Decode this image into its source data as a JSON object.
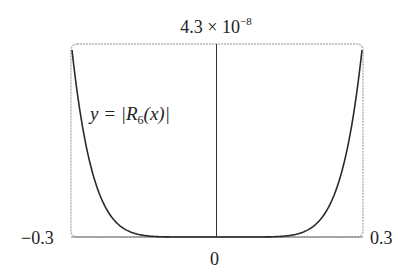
{
  "chart_data": {
    "type": "line",
    "title": "",
    "function_label": {
      "prefix": "y = |R",
      "subscript": "6",
      "suffix": "(x)|"
    },
    "xlabel": "",
    "ylabel": "",
    "xlim": [
      -0.3,
      0.3
    ],
    "ylim": [
      0,
      4.3e-08
    ],
    "x_tick_labels": {
      "left": "−0.3",
      "center": "0",
      "right": "0.3"
    },
    "y_max_label": {
      "mantissa": "4.3 × 10",
      "exponent": "−8"
    },
    "grid": false,
    "legend": "none",
    "series": [
      {
        "name": "|R6(x)|",
        "x": [
          -0.3,
          -0.25,
          -0.2,
          -0.15,
          -0.1,
          -0.05,
          0,
          0.05,
          0.1,
          0.15,
          0.2,
          0.25,
          0.3
        ],
        "values": [
          4.3e-08,
          1.19e-08,
          2.4e-09,
          3.4e-10,
          2e-11,
          1.6e-13,
          0,
          1.6e-13,
          2e-11,
          3.4e-10,
          2.4e-09,
          1.19e-08,
          4.3e-08
        ]
      }
    ],
    "colors": {
      "curve": "#2a2a2a",
      "axis": "#333333",
      "frame": "#b5b5b5"
    }
  }
}
